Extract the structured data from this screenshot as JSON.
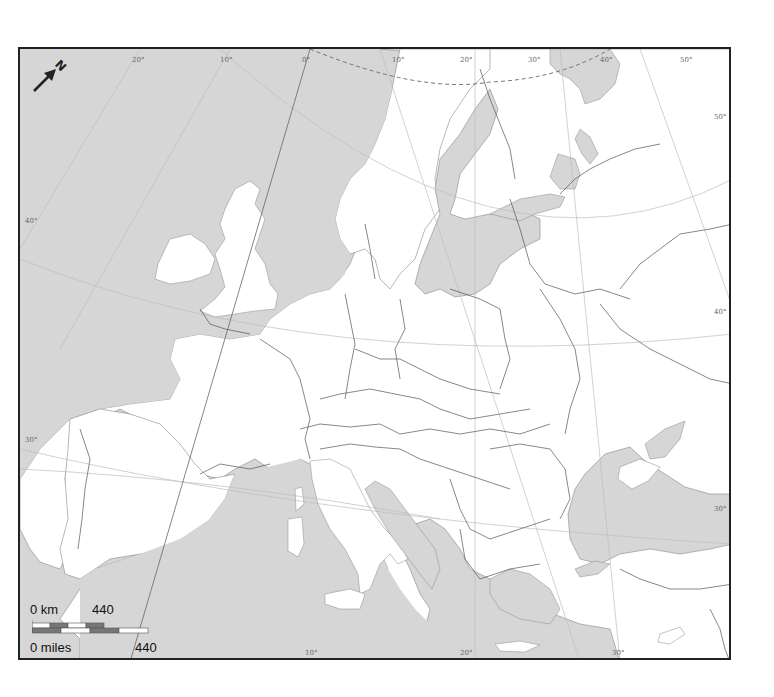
{
  "map": {
    "title": "Europe outline map",
    "colors": {
      "sea": "#d6d6d6",
      "land": "#ffffff",
      "border": "#555555",
      "frame": "#222222",
      "graticule": "#bdbdbd",
      "scale_dark": "#777777"
    },
    "north_arrow": {
      "label": "N"
    },
    "graticule_labels": {
      "top": [
        "20°",
        "10°",
        "0°",
        "10°",
        "20°",
        "30°",
        "40°",
        "50°"
      ],
      "left": [
        "40°",
        "30°"
      ],
      "right": [
        "50°",
        "40°",
        "30°"
      ],
      "bottom": [
        "10°",
        "20°",
        "30°"
      ]
    },
    "scale_bar": {
      "km_start": "0 km",
      "km_end": "440",
      "miles_start": "0 miles",
      "miles_end": "440"
    }
  }
}
